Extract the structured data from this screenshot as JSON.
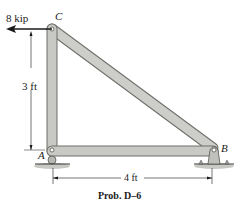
{
  "figure": {
    "type": "truss",
    "joints": {
      "A": {
        "label": "A",
        "support": "roller"
      },
      "B": {
        "label": "B",
        "support": "pin"
      },
      "C": {
        "label": "C"
      }
    },
    "members": [
      "AC",
      "AB",
      "CB"
    ],
    "load": {
      "label": "8 kip",
      "joint": "C",
      "direction": "left"
    },
    "dimensions": {
      "vertical": "3 ft",
      "horizontal": "4 ft"
    },
    "caption": "Prob. D–6"
  },
  "colors": {
    "member_fill": "#c8c8c4",
    "member_stroke": "#6e6e6a",
    "ground": "#b8b8b4",
    "line": "#1a1a1a"
  }
}
